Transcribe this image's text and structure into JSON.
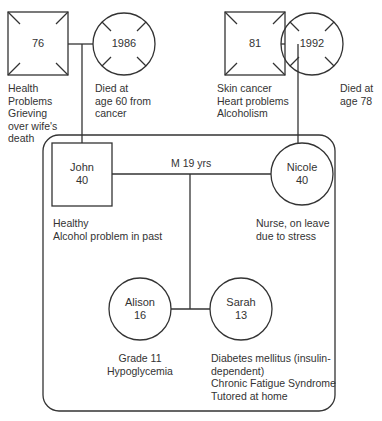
{
  "diagram": {
    "type": "genogram",
    "paternal_grandparents": {
      "grandfather": {
        "shape": "square",
        "label": "76",
        "deceased": false,
        "notes": [
          "Health",
          "Problems",
          "Grieving",
          "over wife's",
          "death"
        ]
      },
      "grandmother": {
        "shape": "circle",
        "label": "1986",
        "deceased": true,
        "notes": [
          "Died at",
          "age 60 from",
          "cancer"
        ]
      }
    },
    "maternal_grandparents": {
      "grandfather": {
        "shape": "square",
        "label": "81",
        "deceased": false,
        "notes": [
          "Skin cancer",
          "Heart problems",
          "Alcoholism"
        ]
      },
      "grandmother": {
        "shape": "circle",
        "label": "1992",
        "deceased": true,
        "notes": [
          "Died at",
          "age 78"
        ]
      }
    },
    "household": {
      "marriage_label": "M 19 yrs",
      "father": {
        "shape": "square",
        "name": "John",
        "age": "40",
        "notes": [
          "Healthy",
          "Alcohol problem in past"
        ]
      },
      "mother": {
        "shape": "circle",
        "name": "Nicole",
        "age": "40",
        "notes": [
          "Nurse, on leave",
          "due to stress"
        ]
      },
      "children": [
        {
          "shape": "circle",
          "name": "Alison",
          "age": "16",
          "notes": [
            "Grade 11",
            "Hypoglycemia"
          ]
        },
        {
          "shape": "circle",
          "name": "Sarah",
          "age": "13",
          "notes": [
            "Diabetes mellitus (insulin-",
            "dependent)",
            "Chronic Fatigue Syndrome",
            "Tutored at home"
          ]
        }
      ]
    },
    "colors": {
      "line": "#333333",
      "text": "#333333",
      "background": "#ffffff"
    }
  }
}
